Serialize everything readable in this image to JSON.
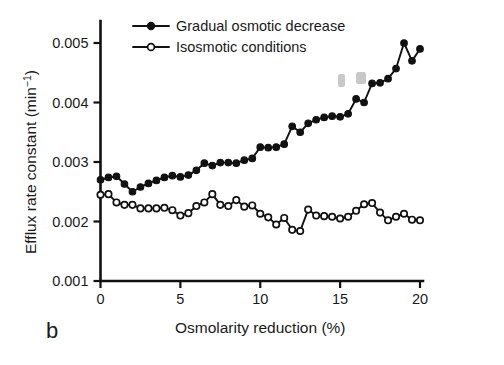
{
  "panel": {
    "label": "b"
  },
  "chart_data": {
    "type": "line",
    "title": "",
    "xlabel": "Osmolarity reduction (%)",
    "ylabel_main": "Efflux rate constant (min",
    "ylabel_sup": "−1",
    "ylabel_close": ")",
    "ylabel_full": "Efflux rate constant (min−1)",
    "xlim": [
      0,
      20
    ],
    "ylim": [
      0.001,
      0.005
    ],
    "xticks": [
      0,
      5,
      10,
      15,
      20
    ],
    "xtick_labels": [
      "0",
      "5",
      "10",
      "15",
      "20"
    ],
    "yticks": [
      0.001,
      0.002,
      0.003,
      0.004,
      0.005
    ],
    "ytick_labels": [
      "0.001",
      "0.002",
      "0.003",
      "0.004",
      "0.005"
    ],
    "grid": false,
    "legend_position": "top-left-inside",
    "series": [
      {
        "name": "Gradual osmotic decrease",
        "marker": "filled-circle",
        "color": "#111111",
        "x": [
          0.0,
          0.5,
          1.0,
          1.5,
          2.0,
          2.5,
          3.0,
          3.5,
          4.0,
          4.5,
          5.0,
          5.5,
          6.0,
          6.5,
          7.0,
          7.5,
          8.0,
          8.5,
          9.0,
          9.5,
          10.0,
          10.5,
          11.0,
          11.5,
          12.0,
          12.5,
          13.0,
          13.5,
          14.0,
          14.5,
          15.0,
          15.5,
          16.0,
          16.5,
          17.0,
          17.5,
          18.0,
          18.5,
          19.0,
          19.5,
          20.0
        ],
        "y": [
          0.0027,
          0.00274,
          0.00276,
          0.00263,
          0.0025,
          0.00258,
          0.00264,
          0.00269,
          0.00274,
          0.00277,
          0.00275,
          0.00278,
          0.00286,
          0.00298,
          0.00294,
          0.00299,
          0.00299,
          0.00298,
          0.00303,
          0.00306,
          0.00325,
          0.00324,
          0.00325,
          0.0033,
          0.0036,
          0.0035,
          0.00365,
          0.00371,
          0.00375,
          0.00377,
          0.00376,
          0.00381,
          0.00406,
          0.004,
          0.00432,
          0.00433,
          0.0044,
          0.00457,
          0.005,
          0.0047,
          0.0049
        ]
      },
      {
        "name": "Isosmotic conditions",
        "marker": "open-circle",
        "color": "#111111",
        "x": [
          0.0,
          0.5,
          1.0,
          1.5,
          2.0,
          2.5,
          3.0,
          3.5,
          4.0,
          4.5,
          5.0,
          5.5,
          6.0,
          6.5,
          7.0,
          7.5,
          8.0,
          8.5,
          9.0,
          9.5,
          10.0,
          10.5,
          11.0,
          11.5,
          12.0,
          12.5,
          13.0,
          13.5,
          14.0,
          14.5,
          15.0,
          15.5,
          16.0,
          16.5,
          17.0,
          17.5,
          18.0,
          18.5,
          19.0,
          19.5,
          20.0
        ],
        "y": [
          0.00245,
          0.00246,
          0.00232,
          0.00228,
          0.00228,
          0.00222,
          0.00222,
          0.00222,
          0.00223,
          0.00219,
          0.0021,
          0.00214,
          0.00226,
          0.00232,
          0.00246,
          0.00228,
          0.00226,
          0.00236,
          0.00225,
          0.00227,
          0.00213,
          0.00207,
          0.00195,
          0.00206,
          0.00186,
          0.00184,
          0.0022,
          0.0021,
          0.00209,
          0.00208,
          0.00205,
          0.00208,
          0.00218,
          0.00229,
          0.00231,
          0.00215,
          0.00202,
          0.00208,
          0.00213,
          0.00203,
          0.00202
        ]
      }
    ]
  },
  "legend": {
    "entries": [
      {
        "label": "Gradual osmotic decrease",
        "marker": "filled-circle"
      },
      {
        "label": "Isosmotic conditions",
        "marker": "open-circle"
      }
    ]
  }
}
